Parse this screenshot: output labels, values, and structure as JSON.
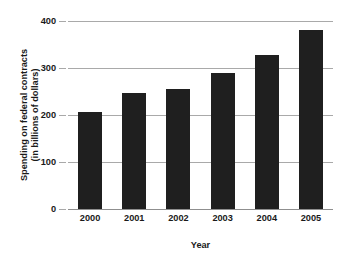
{
  "chart_data": {
    "type": "bar",
    "title": "",
    "categories": [
      "2000",
      "2001",
      "2002",
      "2003",
      "2004",
      "2005"
    ],
    "values": [
      207,
      247,
      255,
      290,
      327,
      381
    ],
    "xlabel": "Year",
    "ylabel": "Spending on federal contracts (in billions of dollars)",
    "ylabel_line1": "Spending on federal contracts",
    "ylabel_line2": "(in billions of dollars)",
    "ylim": [
      0,
      400
    ],
    "yticks": [
      0,
      100,
      200,
      300,
      400
    ],
    "ytick_labels": [
      "0",
      "100",
      "200",
      "300",
      "400"
    ],
    "grid": true,
    "legend": "none",
    "bar_color": "#1f1f1f",
    "gridline_color": "#a9a9a9",
    "background_color": "#ffffff"
  }
}
